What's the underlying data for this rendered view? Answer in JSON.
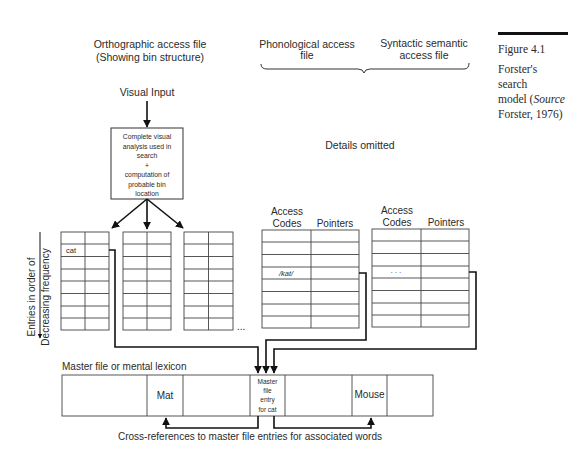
{
  "figure": {
    "number": "Figure 4.1",
    "caption_lines": [
      "Forster's search",
      "model (",
      "Source",
      "Forster, 1976)"
    ],
    "caption_plain": "Forster's search model (Source Forster, 1976)"
  },
  "headers": {
    "orthographic_line1": "Orthographic access file",
    "orthographic_line2": "(Showing bin structure)",
    "phonological_line1": "Phonological access",
    "phonological_line2": "file",
    "syntactic_line1": "Syntactic semantic",
    "syntactic_line2": "access file",
    "details_omitted": "Details omitted"
  },
  "visual_input": {
    "label": "Visual Input",
    "analysis_box_lines": [
      "Complete visual",
      "analysis used in",
      "search",
      "+",
      "computation of",
      "probable bin",
      "location"
    ]
  },
  "side_label": {
    "line1": "Entries in order of",
    "line2": "Decreasing frequency"
  },
  "bins": {
    "count": 3,
    "rows": 8,
    "entries": [
      {
        "row": 1,
        "text": "cat"
      }
    ],
    "ellipsis": "..."
  },
  "access_tables": [
    {
      "col1": "Access",
      "col1b": "Codes",
      "col2": "Pointers",
      "entry": "/kat/"
    },
    {
      "col1": "Access",
      "col1b": "Codes",
      "col2": "Pointers",
      "entry": "· · ·"
    }
  ],
  "master_file": {
    "label": "Master file or mental lexicon",
    "cells": [
      "",
      "Mat",
      "",
      "Master file entry for cat",
      "",
      "Mouse",
      ""
    ],
    "entry_lines": [
      "Master",
      "file",
      "entry",
      "for cat"
    ]
  },
  "cross_reference_label": "Cross-references to master file entries for associated words"
}
